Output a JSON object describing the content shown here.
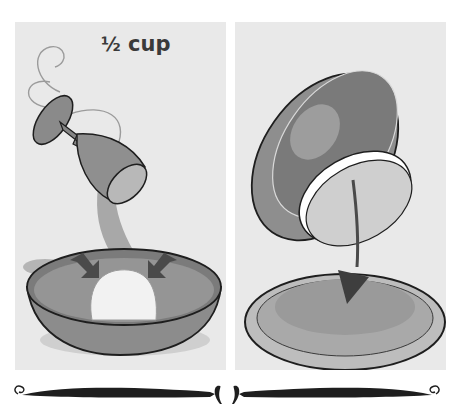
{
  "illustration": {
    "title": "Recipe step illustration",
    "panels": [
      {
        "id": "pour-step",
        "caption": "½ cup",
        "caption_whole": "",
        "caption_fraction": "½",
        "caption_unit": "cup",
        "elements": [
          "goblet pouring liquid",
          "bowl",
          "dough ball",
          "two press arrows"
        ]
      },
      {
        "id": "transfer-step",
        "elements": [
          "inverted bowl",
          "flat dough disc",
          "curved down arrow",
          "plate"
        ]
      }
    ],
    "colors": {
      "panel_bg": "#e9e9e9",
      "page_bg": "#ffffff",
      "outline": "#1e1e1e",
      "bowl_dark": "#7d7d7d",
      "bowl_mid": "#9a9a9a",
      "dough": "#f2f2f2",
      "arrow": "#4a4a4a"
    }
  }
}
